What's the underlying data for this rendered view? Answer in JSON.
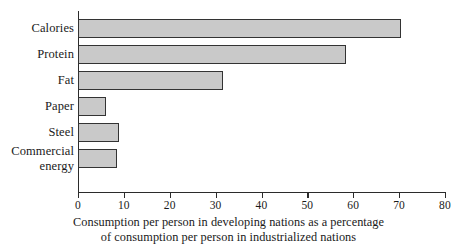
{
  "chart_data": {
    "type": "bar",
    "orientation": "horizontal",
    "title": "",
    "subtitle": "",
    "xlabel_line1": "Consumption per person in developing nations as a percentage",
    "xlabel_line2": "of consumption per person in industrialized nations",
    "ylabel": "",
    "categories": [
      "Calories",
      "Protein",
      "Fat",
      "Paper",
      "Steel",
      "Commercial\nenergy"
    ],
    "values": [
      70.5,
      58.5,
      31.7,
      6,
      9,
      8.6
    ],
    "xlim": [
      0,
      80
    ],
    "xticks": [
      0,
      10,
      20,
      30,
      40,
      50,
      60,
      70,
      80
    ],
    "xtick_labels": [
      "0",
      "10",
      "20",
      "30",
      "40",
      "50",
      "60",
      "70",
      "80"
    ],
    "grid": false,
    "legend": null,
    "bar_fill_color": "#c9c9c9",
    "bar_border_color": "#333333",
    "axis_color": "#2b2b2b",
    "background_color": "#ffffff"
  }
}
